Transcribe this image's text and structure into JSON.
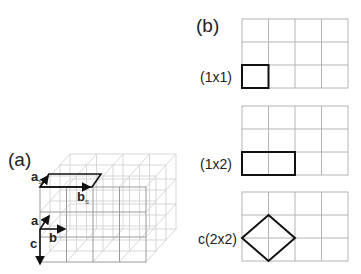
{
  "panels": {
    "a": {
      "label": "(a)",
      "vectors": {
        "a": "a",
        "b": "b",
        "c": "c",
        "a_s": "a",
        "a_s_sub": "s",
        "b_s": "b",
        "b_s_sub": "s"
      }
    },
    "b": {
      "label": "(b)",
      "reconstructions": [
        {
          "label": "(1x1)",
          "shape": "square",
          "cells": "1x1"
        },
        {
          "label": "(1x2)",
          "shape": "rectangle",
          "cells": "1x2"
        },
        {
          "label": "c(2x2)",
          "shape": "diamond",
          "cells": "c(2x2)"
        }
      ],
      "grid": {
        "columns": 4,
        "rows": 3
      }
    }
  },
  "colors": {
    "outline": "#111111",
    "grid": "#b4b4b4",
    "lattice_back": "#d2d2d2"
  }
}
